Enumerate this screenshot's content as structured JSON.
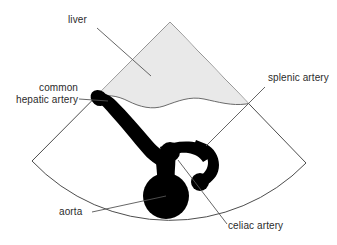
{
  "figure": {
    "type": "anatomical-ultrasound-schematic",
    "background_color": "#ffffff",
    "sector": {
      "name": "ultrasound-sector-field",
      "outline_color": "#4d4d4d",
      "fill_color": "#ffffff",
      "apex": [
        170,
        22
      ],
      "left_corner": [
        32,
        161
      ],
      "right_corner": [
        306,
        163
      ],
      "arc_bottom_center_y": 219
    },
    "liver_region": {
      "name": "liver-region",
      "fill_color": "#e9e9e9",
      "outline_color": "#6a6a6a",
      "description": "Grey shaded wedge occupying the upper part of the sector, bounded below by a wavy hepatic margin"
    },
    "vessels": {
      "name": "vessel-tree",
      "fill_color": "#000000",
      "description": "Black branching arterial tree: common hepatic artery running from upper-left, celiac trunk, aortic bulb and curling splenic artery"
    }
  },
  "labels": [
    {
      "id": "liver",
      "name": "label-liver",
      "text": "liver",
      "align": "left",
      "x": 68,
      "y": 20,
      "leader": {
        "from": [
          97,
          28
        ],
        "to": [
          151,
          76
        ]
      }
    },
    {
      "id": "common-hepatic-artery",
      "name": "label-common-hepatic-artery",
      "text": "common\nhepatic artery",
      "align": "right",
      "x": 5,
      "y": 83,
      "leader": {
        "from": [
          79,
          99
        ],
        "to": [
          108,
          101
        ]
      }
    },
    {
      "id": "splenic-artery",
      "name": "label-splenic-artery",
      "text": "splenic artery",
      "align": "left",
      "x": 268,
      "y": 78,
      "leader": {
        "from": [
          265,
          87
        ],
        "to": [
          206,
          146
        ]
      }
    },
    {
      "id": "aorta",
      "name": "label-aorta",
      "text": "aorta",
      "align": "left",
      "x": 59,
      "y": 212,
      "leader": {
        "from": [
          92,
          212
        ],
        "to": [
          166,
          196
        ]
      }
    },
    {
      "id": "celiac-artery",
      "name": "label-celiac-artery",
      "text": "celiac artery",
      "align": "left",
      "x": 228,
      "y": 225,
      "leader": {
        "from": [
          227,
          224
        ],
        "to": [
          178,
          160
        ]
      }
    }
  ],
  "colors": {
    "vessel": "#000000",
    "liver_fill": "#e9e9e9",
    "sector_outline": "#4d4d4d",
    "leader_line": "#555555",
    "text": "#2b2b2b",
    "page_background": "#ffffff"
  }
}
